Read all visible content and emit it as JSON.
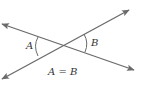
{
  "diagram": {
    "labels": {
      "angle_a": "A",
      "angle_b": "B",
      "equation": "A = B"
    },
    "colors": {
      "line": "#6a6a6a",
      "text": "#333333"
    }
  }
}
